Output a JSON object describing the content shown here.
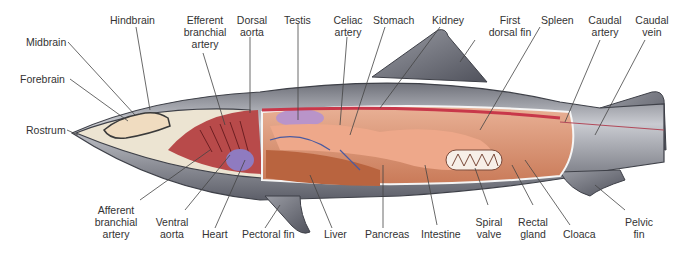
{
  "colors": {
    "skin": "#8a8c93",
    "skin_light": "#c4c6cc",
    "skin_dark": "#5a5c66",
    "head_cavity": "#e9e1cf",
    "brain": "#f0dcc0",
    "gill_chamber": "#b84a4a",
    "body_cavity": "#d98a6a",
    "liver": "#b9643f",
    "stomach": "#e8a184",
    "testis": "#b994c9",
    "heart": "#8f7bc0",
    "vessel_red": "#c8384a",
    "vessel_blue": "#4a5aa0",
    "leader_line": "#444444",
    "text": "#333333"
  },
  "labels": {
    "midbrain": "Midbrain",
    "hindbrain": "Hindbrain",
    "forebrain": "Forebrain",
    "rostrum": "Rostrum",
    "efferent_branchial_artery": "Efferent\nbranchial\nartery",
    "dorsal_aorta": "Dorsal\naorta",
    "testis": "Testis",
    "celiac_artery": "Celiac\nartery",
    "stomach": "Stomach",
    "kidney": "Kidney",
    "first_dorsal_fin": "First\ndorsal fin",
    "spleen": "Spleen",
    "caudal_artery": "Caudal\nartery",
    "caudal_vein": "Caudal\nvein",
    "afferent_branchial_artery": "Afferent\nbranchial\nartery",
    "ventral_aorta": "Ventral\naorta",
    "heart": "Heart",
    "pectoral_fin": "Pectoral fin",
    "liver": "Liver",
    "pancreas": "Pancreas",
    "intestine": "Intestine",
    "spiral_valve": "Spiral\nvalve",
    "rectal_gland": "Rectal\ngland",
    "cloaca": "Cloaca",
    "pelvic_fin": "Pelvic\nfin"
  }
}
